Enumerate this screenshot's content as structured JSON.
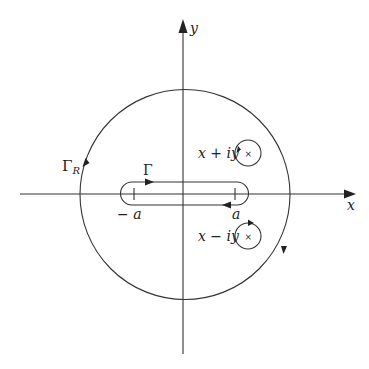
{
  "diagram": {
    "axes": {
      "x_label": "x",
      "y_label": "y"
    },
    "contours": {
      "big_circle_label": "Γ",
      "big_circle_subscript": "R",
      "keyhole_label": "Γ"
    },
    "points": {
      "upper_pole_label": "x + iy",
      "lower_pole_label": "x − iy",
      "left_tick_label": "− a",
      "right_tick_label": "a"
    },
    "colors": {
      "stroke": "#333333",
      "background": "#ffffff"
    }
  }
}
